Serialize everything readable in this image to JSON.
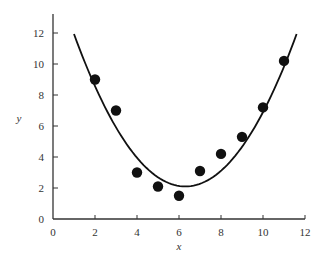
{
  "chart_data": {
    "type": "scatter",
    "title": "",
    "xlabel": "x",
    "ylabel": "y",
    "xlim": [
      0,
      12
    ],
    "ylim": [
      0,
      12
    ],
    "xticks": [
      0,
      2,
      4,
      6,
      8,
      10,
      12
    ],
    "yticks": [
      0,
      2,
      4,
      6,
      8,
      10,
      12
    ],
    "grid": false,
    "legend": null,
    "series": [
      {
        "name": "data",
        "kind": "scatter",
        "marker": "filled-circle",
        "color": "#111111",
        "x": [
          2,
          3,
          4,
          5,
          6,
          7,
          8,
          9,
          10,
          11
        ],
        "y": [
          9.0,
          7.0,
          3.0,
          2.1,
          1.5,
          3.1,
          4.2,
          5.3,
          7.2,
          10.2
        ]
      },
      {
        "name": "fitted curve",
        "kind": "line",
        "color": "#111111",
        "model": "quadratic",
        "params": {
          "a": 0.35,
          "h": 6.3,
          "k": 2.1
        },
        "x_range": [
          1.0,
          11.6
        ]
      }
    ]
  }
}
